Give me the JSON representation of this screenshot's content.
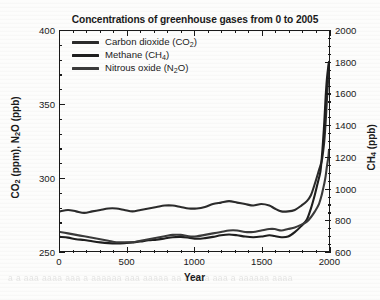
{
  "chart_data": {
    "type": "line",
    "title": "Concentrations of greenhouse gases from 0 to 2005",
    "xlabel": "Year",
    "ylabel": "CO2 (ppm), N2O (ppb)",
    "ylabel_right": "CH4 (ppb)",
    "xlim": [
      0,
      2005
    ],
    "ylim_left": [
      250,
      400
    ],
    "ylim_right": [
      600,
      2000
    ],
    "grid": false,
    "legend_position": "upper left inside axes",
    "x_ticks": [
      0,
      500,
      1000,
      1500,
      2000
    ],
    "x_minor_step": 100,
    "y_ticks_left": [
      250,
      300,
      350,
      400
    ],
    "y_minor_step_left": 10,
    "y_ticks_right": [
      600,
      800,
      1000,
      1200,
      1400,
      1600,
      1800,
      2000
    ],
    "y_minor_step_right": 50,
    "series": [
      {
        "name": "Carbon dioxide (CO2)",
        "legend_label": "Carbon dioxide (CO₂)",
        "axis": "left",
        "unit": "ppm",
        "color": "#2b2b2b",
        "x": [
          0,
          60,
          120,
          180,
          240,
          300,
          360,
          420,
          480,
          540,
          600,
          660,
          720,
          780,
          840,
          900,
          960,
          1020,
          1080,
          1140,
          1200,
          1260,
          1320,
          1380,
          1440,
          1500,
          1560,
          1600,
          1650,
          1700,
          1750,
          1800,
          1840,
          1870,
          1900,
          1930,
          1950,
          1960,
          1970,
          1980,
          1990,
          2000,
          2005
        ],
        "y": [
          277,
          278,
          277,
          276,
          277,
          278,
          279,
          279,
          278,
          277,
          278,
          279,
          280,
          281,
          281,
          280,
          279,
          279,
          280,
          282,
          283,
          284,
          283,
          282,
          281,
          282,
          281,
          279,
          277,
          277,
          278,
          281,
          284,
          288,
          296,
          305,
          311,
          317,
          325,
          338,
          354,
          369,
          379
        ]
      },
      {
        "name": "Methane (CH4)",
        "legend_label": "Methane (CH₄)",
        "axis": "right",
        "unit": "ppb",
        "color": "#1e1e1e",
        "x": [
          0,
          60,
          120,
          180,
          240,
          300,
          360,
          420,
          480,
          540,
          600,
          660,
          720,
          780,
          840,
          900,
          960,
          1020,
          1080,
          1140,
          1200,
          1260,
          1320,
          1380,
          1440,
          1500,
          1560,
          1600,
          1650,
          1700,
          1750,
          1800,
          1840,
          1870,
          1900,
          1920,
          1940,
          1950,
          1960,
          1970,
          1980,
          1990,
          2000,
          2005
        ],
        "y": [
          690,
          685,
          675,
          670,
          662,
          655,
          650,
          648,
          650,
          655,
          660,
          668,
          672,
          680,
          688,
          690,
          685,
          678,
          682,
          690,
          700,
          705,
          700,
          692,
          688,
          692,
          700,
          695,
          688,
          692,
          720,
          760,
          800,
          870,
          960,
          1030,
          1100,
          1180,
          1290,
          1420,
          1580,
          1700,
          1775,
          1800
        ]
      },
      {
        "name": "Nitrous oxide (N2O)",
        "legend_label": "Nitrous oxide (N₂O)",
        "axis": "left",
        "unit": "ppb",
        "color": "#3a3a3a",
        "x": [
          0,
          60,
          120,
          180,
          240,
          300,
          360,
          420,
          480,
          540,
          600,
          660,
          720,
          780,
          840,
          900,
          960,
          1020,
          1080,
          1140,
          1200,
          1260,
          1320,
          1380,
          1440,
          1500,
          1560,
          1600,
          1650,
          1700,
          1750,
          1800,
          1840,
          1870,
          1900,
          1930,
          1950,
          1960,
          1970,
          1980,
          1990,
          2000,
          2005
        ],
        "y": [
          263,
          262,
          261,
          260,
          259,
          258,
          257,
          256,
          256,
          256,
          257,
          258,
          259,
          260,
          261,
          261,
          260,
          260,
          261,
          262,
          263,
          264,
          264,
          263,
          263,
          264,
          265,
          265,
          264,
          265,
          266,
          268,
          270,
          273,
          277,
          282,
          288,
          292,
          296,
          301,
          308,
          314,
          319
        ]
      }
    ],
    "annotations": []
  },
  "axes": {
    "left": {
      "title_html": "CO<sub>2</sub> (ppm), N<sub>2</sub>O (ppb)",
      "ticks": [
        "400",
        "350",
        "300",
        "250"
      ]
    },
    "right": {
      "title_html": "CH<sub>4</sub> (ppb)",
      "ticks": [
        "2000",
        "1800",
        "1600",
        "1400",
        "1200",
        "1000",
        "800",
        "600"
      ]
    },
    "bottom": {
      "title": "Year",
      "ticks": [
        "0",
        "500",
        "1000",
        "1500",
        "2000"
      ]
    }
  },
  "legend": {
    "items": [
      {
        "label_html": "Carbon dioxide (CO<sub>2</sub>)",
        "color": "#2b2b2b"
      },
      {
        "label_html": "Methane (CH<sub>4</sub>)",
        "color": "#1e1e1e"
      },
      {
        "label_html": "Nitrous oxide (N<sub>2</sub>O)",
        "color": "#3a3a3a"
      }
    ]
  },
  "page": {
    "bleed_text": "a a aaa  aaaa aaa a  aaaaaa  aaa  aaaaa  aa aaaaa aaa a aaaaaa aaaa"
  }
}
